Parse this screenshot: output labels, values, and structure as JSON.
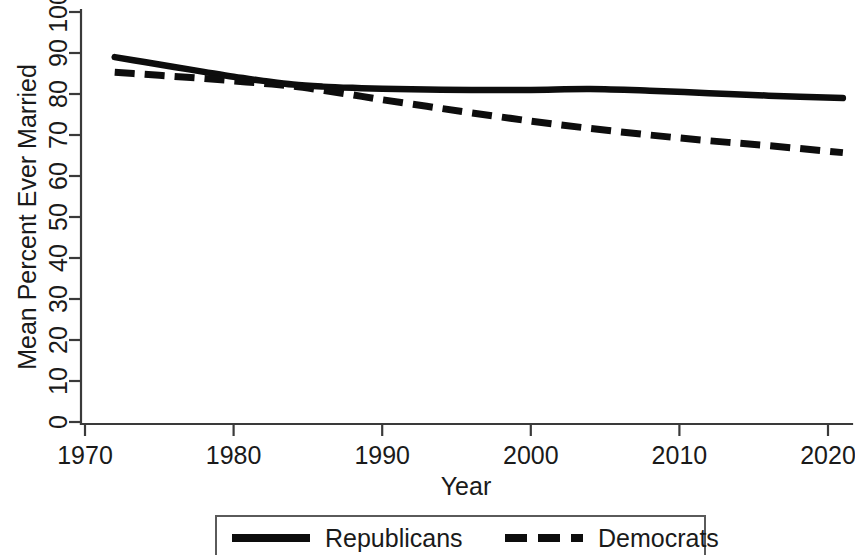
{
  "chart_data": {
    "type": "line",
    "title": "",
    "subtitle": "",
    "xlabel": "Year",
    "ylabel": "Mean Percent Ever Married",
    "xlim": [
      1970,
      2021
    ],
    "ylim": [
      0,
      100
    ],
    "grid": false,
    "legend_position": "bottom",
    "x_ticks": [
      "1970",
      "1980",
      "1990",
      "2000",
      "2010",
      "2020"
    ],
    "x_tick_values": [
      1970,
      1980,
      1990,
      2000,
      2010,
      2020
    ],
    "y_ticks": [
      "0",
      "10",
      "20",
      "30",
      "40",
      "50",
      "60",
      "70",
      "80",
      "90",
      "100"
    ],
    "y_tick_values": [
      0,
      10,
      20,
      30,
      40,
      50,
      60,
      70,
      80,
      90,
      100
    ],
    "series": [
      {
        "name": "Republicans",
        "style": "solid",
        "color": "#0d0d0d",
        "x": [
          1972,
          1974,
          1976,
          1978,
          1980,
          1982,
          1984,
          1986,
          1988,
          1990,
          1993,
          1996,
          2000,
          2004,
          2008,
          2012,
          2016,
          2021
        ],
        "values": [
          89.0,
          87.8,
          86.6,
          85.4,
          84.2,
          83.2,
          82.3,
          81.8,
          81.5,
          81.3,
          81.1,
          81.0,
          81.0,
          81.2,
          80.8,
          80.2,
          79.6,
          79.0
        ]
      },
      {
        "name": "Democrats",
        "style": "dashed",
        "color": "#0d0d0d",
        "x": [
          1972,
          1974,
          1976,
          1978,
          1980,
          1982,
          1984,
          1986,
          1988,
          1990,
          1993,
          1996,
          2000,
          2004,
          2008,
          2012,
          2016,
          2021
        ],
        "values": [
          85.3,
          84.8,
          84.3,
          83.8,
          83.2,
          82.6,
          81.9,
          80.9,
          79.8,
          78.6,
          77.0,
          75.4,
          73.4,
          71.6,
          70.0,
          68.6,
          67.4,
          65.7
        ]
      }
    ]
  },
  "legend": {
    "items": [
      {
        "label": "Republicans",
        "style": "solid"
      },
      {
        "label": "Democrats",
        "style": "dashed"
      }
    ]
  }
}
